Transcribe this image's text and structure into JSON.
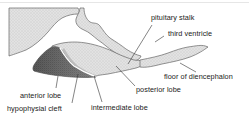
{
  "diagram": {
    "labels": {
      "pituitary_stalk": "pituitary stalk",
      "third_ventricle": "third ventricle",
      "floor_of_diencephalon": "floor of diencephalon",
      "posterior_lobe": "posterior lobe",
      "anterior_lobe": "anterior lobe",
      "intermediate_lobe": "intermediate lobe",
      "hypophysial_cleft": "hypophysial cleft"
    },
    "colors": {
      "light_tissue": "#d9d9d9",
      "dark_tissue": "#6e6e6e",
      "outline": "#555555",
      "leader_line": "#333333",
      "text": "#222222"
    }
  }
}
